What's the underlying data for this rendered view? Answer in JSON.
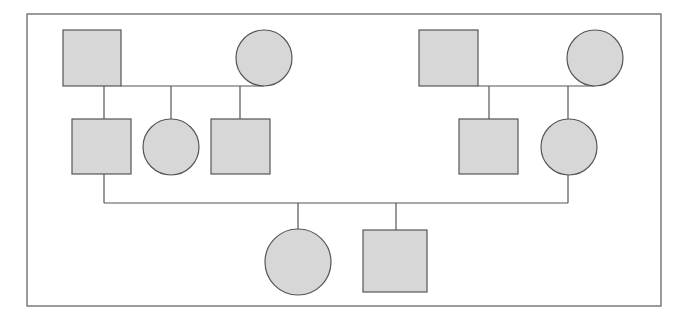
{
  "diagram": {
    "type": "pedigree-chart",
    "colors": {
      "background": "#ffffff",
      "fill": "#d7d7d7",
      "stroke": "#555555",
      "frame": "#666666"
    },
    "frame": {
      "x": 27,
      "y": 14,
      "w": 634,
      "h": 292
    },
    "individuals": [
      {
        "id": "g1-paternal-grandfather",
        "sex": "male",
        "shape": "square",
        "x": 63,
        "y": 30,
        "w": 58,
        "h": 56
      },
      {
        "id": "g1-paternal-grandmother",
        "sex": "female",
        "shape": "circle",
        "cx": 264,
        "cy": 58,
        "r": 28
      },
      {
        "id": "g1-maternal-grandfather",
        "sex": "male",
        "shape": "square",
        "x": 419,
        "y": 30,
        "w": 59,
        "h": 56
      },
      {
        "id": "g1-maternal-grandmother",
        "sex": "female",
        "shape": "circle",
        "cx": 595,
        "cy": 58,
        "r": 28
      },
      {
        "id": "g2-father",
        "sex": "male",
        "shape": "square",
        "x": 72,
        "y": 119,
        "w": 59,
        "h": 55
      },
      {
        "id": "g2-paternal-aunt",
        "sex": "female",
        "shape": "circle",
        "cx": 171,
        "cy": 147,
        "r": 28
      },
      {
        "id": "g2-paternal-uncle",
        "sex": "male",
        "shape": "square",
        "x": 211,
        "y": 119,
        "w": 59,
        "h": 55
      },
      {
        "id": "g2-maternal-uncle",
        "sex": "male",
        "shape": "square",
        "x": 459,
        "y": 119,
        "w": 59,
        "h": 55
      },
      {
        "id": "g2-mother",
        "sex": "female",
        "shape": "circle",
        "cx": 569,
        "cy": 147,
        "r": 28
      },
      {
        "id": "g3-daughter",
        "sex": "female",
        "shape": "circle",
        "cx": 298,
        "cy": 262,
        "r": 33
      },
      {
        "id": "g3-son",
        "sex": "male",
        "shape": "square",
        "x": 363,
        "y": 230,
        "w": 64,
        "h": 62
      }
    ],
    "lines": [
      {
        "id": "paternal-marriage-line",
        "x1": 121,
        "y1": 86,
        "x2": 264,
        "y2": 86
      },
      {
        "id": "paternal-descent-father",
        "x1": 104,
        "y1": 86,
        "x2": 104,
        "y2": 119
      },
      {
        "id": "paternal-descent-aunt",
        "x1": 171,
        "y1": 86,
        "x2": 171,
        "y2": 119
      },
      {
        "id": "paternal-descent-uncle",
        "x1": 240,
        "y1": 86,
        "x2": 240,
        "y2": 119
      },
      {
        "id": "maternal-marriage-line",
        "x1": 478,
        "y1": 86,
        "x2": 595,
        "y2": 86
      },
      {
        "id": "maternal-descent-uncle",
        "x1": 489,
        "y1": 86,
        "x2": 489,
        "y2": 119
      },
      {
        "id": "maternal-descent-mother",
        "x1": 568,
        "y1": 86,
        "x2": 568,
        "y2": 119
      },
      {
        "id": "father-down-line",
        "x1": 104,
        "y1": 174,
        "x2": 104,
        "y2": 203
      },
      {
        "id": "mother-down-line",
        "x1": 568,
        "y1": 175,
        "x2": 568,
        "y2": 203
      },
      {
        "id": "parents-marriage-line",
        "x1": 104,
        "y1": 203,
        "x2": 568,
        "y2": 203
      },
      {
        "id": "descent-daughter",
        "x1": 298,
        "y1": 203,
        "x2": 298,
        "y2": 229
      },
      {
        "id": "descent-son",
        "x1": 396,
        "y1": 203,
        "x2": 396,
        "y2": 230
      }
    ]
  }
}
